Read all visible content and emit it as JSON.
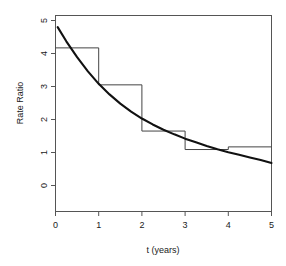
{
  "chart_data": {
    "type": "line",
    "title": "",
    "xlabel": "t (years)",
    "ylabel": "Rate Ratio",
    "xlim": [
      0,
      5
    ],
    "ylim": [
      0,
      5
    ],
    "xticks": [
      0,
      1,
      2,
      3,
      4,
      5
    ],
    "xtick_labels": [
      "0",
      "1",
      "2",
      "3",
      "4",
      "5"
    ],
    "yticks": [
      0,
      1,
      2,
      3,
      4,
      5
    ],
    "ytick_labels": [
      "0",
      "1",
      "2",
      "3",
      "4",
      "5"
    ],
    "grid": false,
    "legend": "none",
    "series": [
      {
        "name": "smooth fitted curve",
        "type": "line",
        "style": "solid-thick",
        "color": "#111111",
        "x": [
          0.05,
          0.25,
          0.5,
          0.75,
          1.0,
          1.25,
          1.5,
          1.75,
          2.0,
          2.25,
          2.5,
          2.75,
          3.0,
          3.25,
          3.5,
          3.75,
          4.0,
          4.25,
          4.5,
          4.75,
          5.0
        ],
        "y": [
          4.8,
          4.37,
          3.89,
          3.46,
          3.08,
          2.76,
          2.48,
          2.24,
          2.03,
          1.85,
          1.69,
          1.55,
          1.42,
          1.31,
          1.2,
          1.1,
          1.01,
          0.93,
          0.85,
          0.77,
          0.68
        ]
      },
      {
        "name": "piecewise constant step estimate",
        "type": "step",
        "style": "solid-thin",
        "color": "#444444",
        "intervals": [
          {
            "start": 0,
            "end": 1,
            "value": 4.17
          },
          {
            "start": 1,
            "end": 2,
            "value": 3.05
          },
          {
            "start": 2,
            "end": 3,
            "value": 1.65
          },
          {
            "start": 3,
            "end": 4,
            "value": 1.09
          },
          {
            "start": 4,
            "end": 5,
            "value": 1.17
          }
        ]
      }
    ]
  },
  "axes": {
    "y_title": "Rate Ratio",
    "x_title": "t (years)"
  }
}
